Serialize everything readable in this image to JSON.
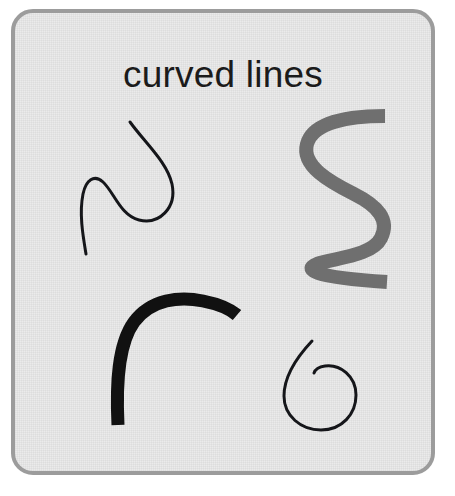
{
  "card": {
    "title": "curved lines",
    "background_color": "#e9e9e9",
    "border_color": "#9c9c9c",
    "title_color": "#1b1b1b",
    "page_background": "#ffffff"
  },
  "figures": [
    {
      "name": "thin-s-curve",
      "description": "thin black S-shaped curve with a hook at the top right",
      "color": "#15161a",
      "stroke_width": 3,
      "path": "M 126 118 C 142 140 163 158 168 180 C 173 204 155 221 135 216 C 116 211 110 188 99 178 C 90 170 82 176 79 190 C 75 210 79 232 82 250"
    },
    {
      "name": "thick-gray-zigzag",
      "description": "thick gray double-curve / zigzag running vertically",
      "color": "#6f6f6f",
      "stroke_width": 14,
      "path": "M 381 112 C 345 112 309 118 303 140 C 297 162 326 178 350 190 C 374 202 386 216 377 234 C 368 252 331 254 313 260 C 300 265 305 273 383 278"
    },
    {
      "name": "thick-black-arch",
      "description": "thick black arch / hook rising from bottom left and bending right",
      "color": "#111111",
      "stroke_width": 13,
      "path": "M 114 421 C 112 380 114 340 130 318 C 147 295 176 292 199 297 C 214 300 226 305 233 311"
    },
    {
      "name": "black-spiral",
      "description": "thin black spiral resembling the numeral six",
      "color": "#15161a",
      "stroke_width": 3,
      "path": "M 308 337 C 292 354 280 374 280 392 C 280 412 297 426 317 426 C 338 426 352 410 352 391 C 352 372 336 360 321 362 C 314 363 311 366 310 369"
    }
  ]
}
